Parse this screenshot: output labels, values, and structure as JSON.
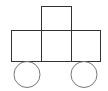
{
  "diagram": {
    "canvas": {
      "width": 108,
      "height": 91,
      "background": "#ffffff"
    },
    "stroke": {
      "square_color": "#333333",
      "wheel_color": "#777777",
      "width": 1
    },
    "squares": [
      {
        "id": "top",
        "x": 41.5,
        "y": 6.5,
        "w": 30,
        "h": 24
      },
      {
        "id": "left",
        "x": 11.5,
        "y": 30.5,
        "w": 30,
        "h": 31
      },
      {
        "id": "middle",
        "x": 41.5,
        "y": 30.5,
        "w": 30,
        "h": 31
      },
      {
        "id": "right",
        "x": 71.5,
        "y": 30.5,
        "w": 29,
        "h": 31
      }
    ],
    "wheels": [
      {
        "id": "left-wheel",
        "cx": 27,
        "cy": 74.5,
        "r": 13
      },
      {
        "id": "right-wheel",
        "cx": 84,
        "cy": 74.5,
        "r": 13
      }
    ]
  }
}
